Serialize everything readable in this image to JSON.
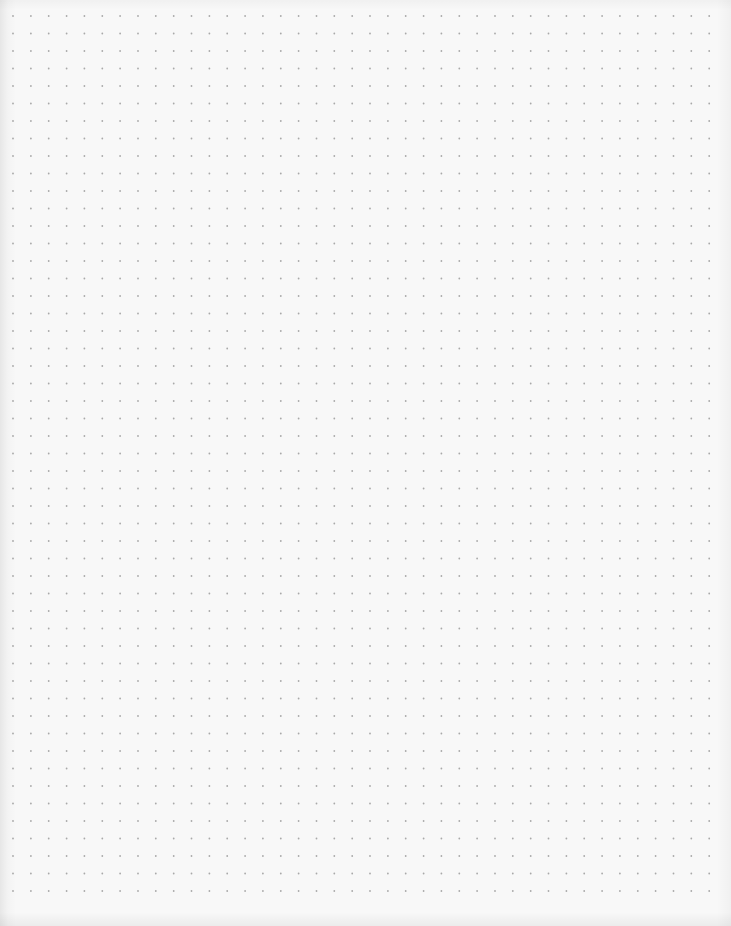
{
  "page": {
    "description": "Blank dot-grid paper page",
    "background_color": "#f8f8f8",
    "dot_color": "#a9a9a9"
  },
  "grid": {
    "columns": 40,
    "rows": 51,
    "spacing_x": 17.85,
    "spacing_y": 17.5,
    "origin_x": 13,
    "origin_y": 16,
    "dot_radius": 0.9
  }
}
